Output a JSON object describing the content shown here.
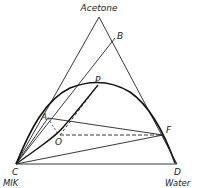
{
  "diagram": {
    "type": "ternary-phase-diagram",
    "components": {
      "top": "Acetone",
      "bottom_left": "MIK",
      "bottom_right": "Water"
    },
    "points": {
      "apex_label": "Acetone",
      "B": "B",
      "P": "P",
      "A": "A",
      "O": "O",
      "F": "F",
      "C": "C",
      "D": "D"
    },
    "bottom_labels": {
      "left": "MIK",
      "right": "Water"
    },
    "colors": {
      "line": "#222222",
      "curve": "#111111",
      "background": "#ffffff"
    }
  }
}
